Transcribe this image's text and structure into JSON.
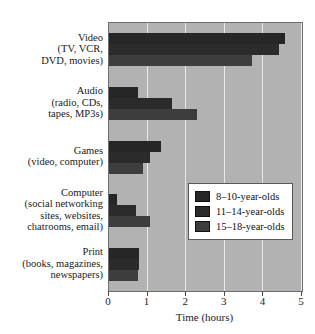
{
  "chart_data": {
    "type": "bar",
    "orientation": "horizontal",
    "title": "",
    "xlabel": "Time (hours)",
    "ylabel": "",
    "xlim": [
      0,
      5
    ],
    "xticks": [
      0,
      1,
      2,
      3,
      4,
      5
    ],
    "xticklabels": [
      "0",
      "1",
      "2",
      "3",
      "4",
      "5"
    ],
    "grid": "vertical",
    "legend_position": "center-right",
    "categories": [
      "Video (TV, VCR, DVD, movies)",
      "Audio (radio, CDs, tapes, MP3s)",
      "Games (video, computer)",
      "Computer (social networking sites, websites, chatrooms, email)",
      "Print (books, magazines, newspapers)"
    ],
    "series": [
      {
        "name": "8–10-year-olds",
        "color": "#262626",
        "values": [
          4.55,
          0.75,
          1.35,
          0.2,
          0.78
        ]
      },
      {
        "name": "11–14-year-olds",
        "color": "#2b2b2b",
        "values": [
          4.4,
          1.63,
          1.05,
          0.7,
          0.78
        ]
      },
      {
        "name": "15–18-year-olds",
        "color": "#3d3d3d",
        "values": [
          3.7,
          2.28,
          0.88,
          1.05,
          0.75
        ]
      }
    ]
  },
  "axis": {
    "x_title": "Time (hours)",
    "tick_labels": [
      "0",
      "1",
      "2",
      "3",
      "4",
      "5"
    ]
  },
  "categories_display": [
    {
      "main": "Video",
      "sub": [
        "(TV, VCR,",
        "DVD, movies)"
      ]
    },
    {
      "main": "Audio",
      "sub": [
        "(radio, CDs,",
        "tapes, MP3s)"
      ]
    },
    {
      "main": "Games",
      "sub": [
        "(video, computer)"
      ]
    },
    {
      "main": "Computer",
      "sub": [
        "(social networking",
        "sites, websites,",
        "chatrooms, email)"
      ]
    },
    {
      "main": "Print",
      "sub": [
        "(books, magazines,",
        "newspapers)"
      ]
    }
  ],
  "legend": {
    "entries": [
      {
        "label": "8–10-year-olds",
        "color": "#262626"
      },
      {
        "label": "11–14-year-olds",
        "color": "#2b2b2b"
      },
      {
        "label": "15–18-year-olds",
        "color": "#3d3d3d"
      }
    ]
  },
  "colors": {
    "plot_background": "#b2b2b2",
    "gridline": "#e9e9e9",
    "frame": "#6f6f6f",
    "page_background": "#ffffff",
    "text": "#1a1a1a"
  }
}
